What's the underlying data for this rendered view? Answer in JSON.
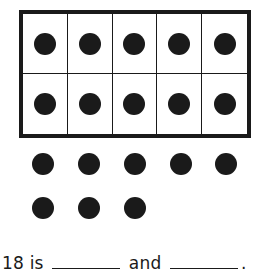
{
  "ten_frame": {
    "rows": 2,
    "columns": 5,
    "filled": 10
  },
  "extra_dots": {
    "row1": 5,
    "row2": 3,
    "total": 8
  },
  "sentence": {
    "number": "18",
    "is": "is",
    "and": "and",
    "period": "."
  },
  "colors": {
    "ink": "#1a1a1a",
    "background": "#ffffff"
  }
}
